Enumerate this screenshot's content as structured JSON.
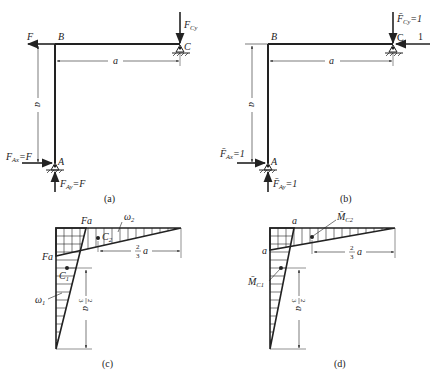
{
  "figure": {
    "panels": [
      {
        "id": "a",
        "caption": "(a)",
        "nodes": {
          "A": "A",
          "B": "B",
          "C": "C"
        },
        "forces": {
          "applied": "F",
          "reaction_C": {
            "main": "F",
            "sub": "Cy",
            "text": "F_Cy"
          },
          "reaction_Ax": {
            "main": "F",
            "sub": "Ax",
            "suffix": "=F",
            "text": "F_Ax=F"
          },
          "reaction_Ay": {
            "main": "F",
            "sub": "Ay",
            "suffix": "=F",
            "text": "F_Ay=F"
          }
        },
        "dimensions": {
          "horizontal": "a",
          "vertical": "a"
        }
      },
      {
        "id": "b",
        "caption": "(b)",
        "nodes": {
          "A": "A",
          "B": "B",
          "C": "C"
        },
        "forces": {
          "unit_load": "1",
          "reaction_C": {
            "main": "F̄",
            "sub": "Cy",
            "suffix": "=1",
            "text": "F̄_Cy=1"
          },
          "reaction_Ax": {
            "main": "F̄",
            "sub": "Ax",
            "suffix": "=1",
            "text": "F̄_Ax=1"
          },
          "reaction_Ay": {
            "main": "F̄",
            "sub": "Ay",
            "suffix": "=1",
            "text": "F̄_Ay=1"
          }
        },
        "dimensions": {
          "horizontal": "a",
          "vertical": "a"
        }
      },
      {
        "id": "c",
        "caption": "(c)",
        "moment_labels": {
          "top": "Fa",
          "left": "Fa"
        },
        "areas": {
          "w1": {
            "main": "ω",
            "sub": "1"
          },
          "w2": {
            "main": "ω",
            "sub": "2"
          }
        },
        "centroids": {
          "C1": {
            "main": "C",
            "sub": "1"
          },
          "C2": {
            "main": "C",
            "sub": "2"
          }
        },
        "dimensions": {
          "horizontal": {
            "num": "2",
            "den": "3",
            "var": "a",
            "text": "2/3 a"
          },
          "vertical": {
            "num": "2",
            "den": "3",
            "var": "a",
            "text": "2/3 a"
          }
        }
      },
      {
        "id": "d",
        "caption": "(d)",
        "moment_labels": {
          "top": "a",
          "left": "a"
        },
        "centroid_moments": {
          "MC1": {
            "main": "M̄",
            "sub": "C1",
            "text": "M̄_C1"
          },
          "MC2": {
            "main": "M̄",
            "sub": "C2",
            "text": "M̄_C2"
          }
        },
        "dimensions": {
          "horizontal": {
            "num": "2",
            "den": "3",
            "var": "a",
            "text": "2/3 a"
          },
          "vertical": {
            "num": "2",
            "den": "3",
            "var": "a",
            "text": "2/3 a"
          }
        }
      }
    ],
    "colors": {
      "line": "#222222",
      "background": "#ffffff"
    }
  }
}
